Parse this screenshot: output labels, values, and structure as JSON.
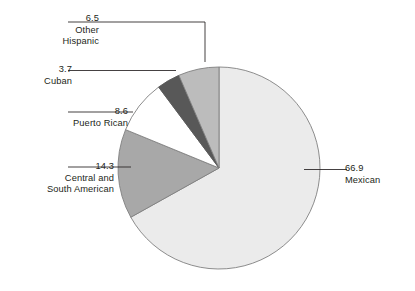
{
  "chart_data": {
    "type": "pie",
    "title": "",
    "subtitle": "",
    "xlabel": "",
    "ylabel": "",
    "legend_position": "callout-labels",
    "grid": false,
    "units": "percent",
    "total": 100.0,
    "categories": [
      "Mexican",
      "Central and South American",
      "Puerto Rican",
      "Cuban",
      "Other Hispanic"
    ],
    "values": [
      66.9,
      14.3,
      8.6,
      3.7,
      6.5
    ],
    "colors": [
      "#ebebeb",
      "#a8a8a8",
      "#ffffff",
      "#585858",
      "#bcbcbc"
    ],
    "slices": [
      {
        "label": "Mexican",
        "value": 66.9,
        "value_text": "66.9",
        "color": "#ebebeb",
        "start_deg": 0,
        "end_deg": 240.84
      },
      {
        "label": "Central and South American",
        "value": 14.3,
        "value_text": "14.3",
        "color": "#a8a8a8",
        "start_deg": 240.84,
        "end_deg": 292.32
      },
      {
        "label": "Puerto Rican",
        "value": 8.6,
        "value_text": "8.6",
        "color": "#ffffff",
        "start_deg": 292.32,
        "end_deg": 323.28
      },
      {
        "label": "Cuban",
        "value": 3.7,
        "value_text": "3.7",
        "color": "#585858",
        "start_deg": 323.28,
        "end_deg": 336.6
      },
      {
        "label": "Other Hispanic",
        "value": 6.5,
        "value_text": "6.5",
        "color": "#bcbcbc",
        "start_deg": 336.6,
        "end_deg": 360
      }
    ],
    "stroke": "#808080"
  },
  "labels": {
    "mexican": {
      "value": "66.9",
      "name": "Mexican"
    },
    "central_south_american": {
      "value": "14.3",
      "name_line1": "Central and",
      "name_line2": "South American"
    },
    "puerto_rican": {
      "value": "8.6",
      "name": "Puerto Rican"
    },
    "cuban": {
      "value": "3.7",
      "name": "Cuban"
    },
    "other_hispanic": {
      "value": "6.5",
      "name_line1": "Other",
      "name_line2": "Hispanic"
    }
  }
}
